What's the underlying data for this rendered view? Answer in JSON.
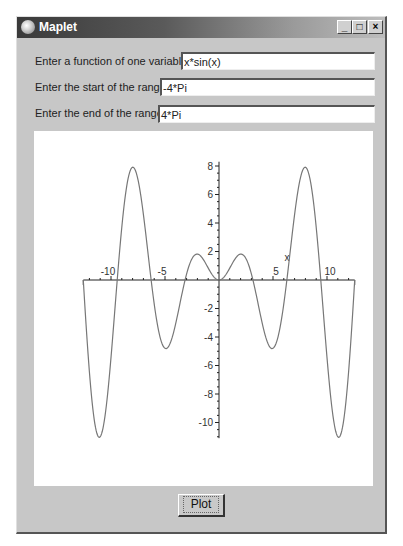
{
  "window": {
    "title": "Maplet",
    "controls": {
      "minimize": "_",
      "maximize": "□",
      "close": "×"
    }
  },
  "form": {
    "function_label": "Enter a function of one variable:",
    "function_value": "x*sin(x)",
    "start_label": "Enter the start of the range:",
    "start_value": "-4*Pi",
    "end_label": "Enter the end of the range:",
    "end_value": "4*Pi"
  },
  "plot_button": {
    "label": "Plot"
  },
  "chart_data": {
    "type": "line",
    "title": "",
    "function": "x*sin(x)",
    "xlabel": "x",
    "ylabel": "",
    "xlim": [
      -12.566,
      12.566
    ],
    "ylim": [
      -11.1,
      8.3
    ],
    "x_ticks": [
      -10,
      -5,
      5,
      10
    ],
    "y_ticks": [
      8,
      6,
      4,
      2,
      -2,
      -4,
      -6,
      -8,
      -10
    ],
    "grid": false,
    "series": [
      {
        "name": "x*sin(x)",
        "x": [
          -12.566,
          -11.085,
          -7.979,
          -4.913,
          -2.029,
          0,
          2.029,
          4.913,
          7.979,
          11.085,
          12.566
        ],
        "values": [
          0,
          -11.04,
          7.92,
          -4.81,
          1.82,
          0,
          1.82,
          -4.81,
          7.92,
          -11.04,
          0
        ]
      }
    ]
  }
}
